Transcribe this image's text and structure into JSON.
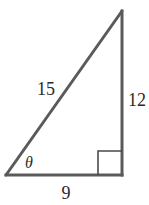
{
  "diagram": {
    "type": "right-triangle",
    "stroke_color": "#5a5a5a",
    "vertices": {
      "bottom_left": [
        6,
        175
      ],
      "bottom_right": [
        122,
        175
      ],
      "top": [
        122,
        11
      ]
    },
    "right_angle_marker": {
      "corner": "bottom_right",
      "size": 24
    },
    "labels": {
      "hypotenuse": "15",
      "vertical_leg": "12",
      "horizontal_leg": "9",
      "angle": "θ"
    },
    "label_positions": {
      "hypotenuse": [
        46,
        89
      ],
      "vertical_leg": [
        136,
        100
      ],
      "horizontal_leg": [
        66,
        193
      ],
      "angle": [
        29,
        164
      ]
    }
  }
}
